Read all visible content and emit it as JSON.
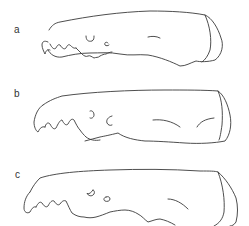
{
  "figure": {
    "background": "#ffffff",
    "line_color": "#3a3a3a",
    "panels": [
      {
        "label": "a",
        "subject": "skull-outline-lateral-view"
      },
      {
        "label": "b",
        "subject": "skull-outline-lateral-view"
      },
      {
        "label": "c",
        "subject": "skull-outline-lateral-view"
      }
    ]
  }
}
